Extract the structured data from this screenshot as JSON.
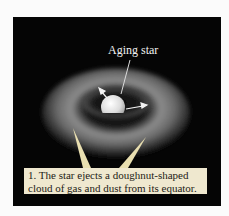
{
  "figure": {
    "label": "Aging star",
    "caption_line1": "1. The star ejects a doughnut-shaped",
    "caption_line2": "cloud of gas and dust from its equator.",
    "colors": {
      "background": "#050505",
      "caption_bg": "#efe8cf",
      "callout": "#e9dfb0",
      "torus": "#8a8a8a",
      "star": "#e6e6e6"
    }
  }
}
